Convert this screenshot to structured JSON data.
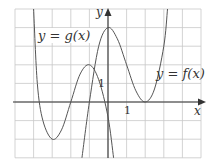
{
  "chart_data": {
    "type": "line",
    "title": "",
    "xlabel": "x",
    "ylabel": "y",
    "xlim": [
      -5,
      5
    ],
    "ylim": [
      -3,
      5
    ],
    "grid": true,
    "grid_step": 1,
    "tick_labels": {
      "x": [
        "1"
      ],
      "y": [
        "1"
      ]
    },
    "series": [
      {
        "name": "y = f(x)",
        "description": "polynomial with local max at (0,4) and tangent to x-axis (double root) at x=2",
        "points": [
          [
            -1.4,
            -3
          ],
          [
            -1,
            0
          ],
          [
            -0.5,
            3
          ],
          [
            0,
            4
          ],
          [
            0.5,
            3.4
          ],
          [
            1,
            2
          ],
          [
            1.5,
            0.6
          ],
          [
            2,
            0
          ],
          [
            2.5,
            0.7
          ],
          [
            3,
            3
          ],
          [
            3.2,
            5
          ]
        ]
      },
      {
        "name": "y = g(x)",
        "description": "polynomial with local min at (-3,-2), local max at (-1,2)",
        "points": [
          [
            -4,
            5
          ],
          [
            -3.8,
            1
          ],
          [
            -3.5,
            -1
          ],
          [
            -3,
            -2
          ],
          [
            -2.5,
            -1.5
          ],
          [
            -2,
            0
          ],
          [
            -1.5,
            1.5
          ],
          [
            -1,
            2
          ],
          [
            -0.5,
            1.2
          ],
          [
            0,
            -0.8
          ],
          [
            0.3,
            -3
          ]
        ]
      }
    ],
    "annotations": [
      {
        "text": "y = g(x)",
        "near": [
          -3,
          4
        ]
      },
      {
        "text": "y = f(x)",
        "near": [
          3.5,
          1.5
        ]
      }
    ]
  },
  "labels": {
    "g_label": "y = g(x)",
    "f_label": "y = f(x)",
    "x_axis": "x",
    "y_axis": "y",
    "x_tick": "1",
    "y_tick": "1"
  }
}
